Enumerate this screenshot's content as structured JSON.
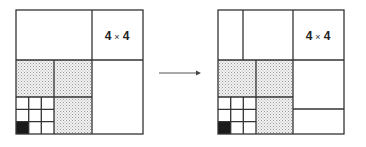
{
  "figure": {
    "type": "quadtree-subdivision",
    "before": {
      "label_block": "4 × 4",
      "label_parts": {
        "left": "4",
        "times": "×",
        "right": "4"
      }
    },
    "after": {
      "label_block": "4 × 4",
      "label_parts": {
        "left": "4",
        "times": "×",
        "right": "4"
      }
    },
    "arrow": "right-arrow",
    "colors": {
      "line": "#333333",
      "stipple": "#c8c8c8",
      "filled_cell": "#1a1a1a",
      "background": "#ffffff"
    }
  }
}
